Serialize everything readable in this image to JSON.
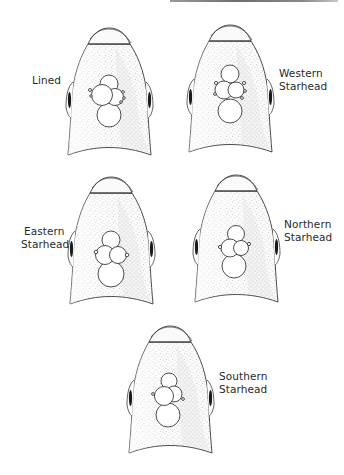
{
  "figure": {
    "title": "",
    "colors": {
      "outline": "#3a3a3a",
      "stipple": "#b8b8b8",
      "eye": "#1a1a1a",
      "background": "#ffffff",
      "top_bar": "#7a7a7a"
    },
    "heads": [
      {
        "id": "lined",
        "label_lines": [
          "Lined"
        ],
        "label_side": "left"
      },
      {
        "id": "western-starhead",
        "label_lines": [
          "Western",
          "Starhead"
        ],
        "label_side": "right"
      },
      {
        "id": "eastern-starhead",
        "label_lines": [
          "Eastern",
          "Starhead"
        ],
        "label_side": "left"
      },
      {
        "id": "northern-starhead",
        "label_lines": [
          "Northern",
          "Starhead"
        ],
        "label_side": "right"
      },
      {
        "id": "southern-starhead",
        "label_lines": [
          "Southern",
          "Starhead"
        ],
        "label_side": "right"
      }
    ]
  }
}
